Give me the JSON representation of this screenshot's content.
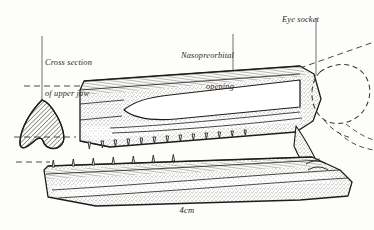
{
  "figure": {
    "background_color": "#fdfdfc",
    "ink_color": "#2a2722",
    "labels": {
      "cross_section_line1": "Cross section",
      "cross_section_line2": "of upper jaw",
      "nasopreorbital_line1": "Nasopreorbital",
      "nasopreorbital_line2": "opening",
      "eye_socket": "Eye socket",
      "scale_bar": "4cm"
    },
    "leader_lines": [
      {
        "name": "cross-section-leader",
        "from_x": 42,
        "from_y": 36,
        "to_x": 42,
        "to_y": 100
      },
      {
        "name": "nasopreorbital-leader",
        "from_x": 233,
        "from_y": 34,
        "to_x": 233,
        "to_y": 112
      },
      {
        "name": "eye-socket-leader",
        "from_x": 316,
        "from_y": 18,
        "to_x": 316,
        "to_y": 76
      }
    ],
    "parts": [
      {
        "name": "cross-section-of-upper-jaw",
        "style": "diagonal-hatched",
        "shape": "shield"
      },
      {
        "name": "upper-jaw-lateral-view",
        "style": "stippled",
        "shape": "elongate-tapering"
      },
      {
        "name": "nasopreorbital-opening",
        "style": "blank-white",
        "shape": "elongate-fenestra"
      },
      {
        "name": "eye-socket",
        "style": "dashed-outline",
        "shape": "rounded-oval"
      },
      {
        "name": "lower-jaw",
        "style": "stippled",
        "shape": "elongate-tapering"
      },
      {
        "name": "upper-jaw-tooth-row",
        "style": "solid-outline",
        "count": 13
      },
      {
        "name": "lower-jaw-tooth-row",
        "style": "solid-outline",
        "count": 7
      }
    ],
    "construction_lines": [
      {
        "name": "upper-alignment-dash",
        "x1": 24,
        "y1": 86,
        "x2": 84,
        "y2": 86
      },
      {
        "name": "lower-alignment-dash",
        "x1": 16,
        "y1": 137,
        "x2": 78,
        "y2": 137
      },
      {
        "name": "jaw-base-dash",
        "x1": 18,
        "y1": 160,
        "x2": 52,
        "y2": 160
      },
      {
        "name": "eye-socket-diagonal-dash",
        "x1": 246,
        "y1": 86,
        "x2": 374,
        "y2": 44
      }
    ]
  }
}
